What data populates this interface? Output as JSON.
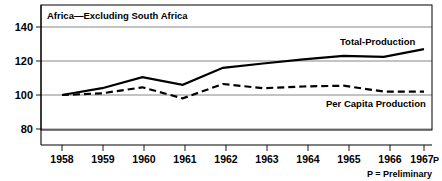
{
  "chart_data": {
    "type": "line",
    "title": "Africa—Excluding South Africa",
    "xlabel": "",
    "ylabel": "",
    "categories": [
      "1958",
      "1959",
      "1960",
      "1961",
      "1962",
      "1963",
      "1964",
      "1965",
      "1966",
      "1967"
    ],
    "x_tick_labels": [
      "1958",
      "1959",
      "1960",
      "1961",
      "1962",
      "1963",
      "1964",
      "1965",
      "1966",
      "1967"
    ],
    "last_tick_suffix": "P",
    "y_tick_labels": [
      "80",
      "100",
      "120",
      "140"
    ],
    "y_ticks": [
      80,
      100,
      120,
      140
    ],
    "ylim": [
      72,
      148
    ],
    "xlim": [
      "1958",
      "1967"
    ],
    "grid": true,
    "legend_position": "inline-annotation",
    "series": [
      {
        "name": "Total-Production",
        "style": "solid",
        "label_text": "Total-Production",
        "values": [
          100,
          104,
          110.5,
          106,
          116,
          118.5,
          121,
          123,
          122.5,
          127
        ]
      },
      {
        "name": "Per Capita Production",
        "style": "dashed",
        "label_text": "Per Capita Production",
        "values": [
          100,
          101,
          104.5,
          98,
          106.5,
          104,
          105,
          105.5,
          102,
          102
        ]
      }
    ],
    "annotations": [
      {
        "name": "total-production-label",
        "text": "Total-Production"
      },
      {
        "name": "per-capita-production-label",
        "text": "Per Capita Production"
      }
    ],
    "footnote": "P = Preliminary",
    "colors": {
      "line": "#000000",
      "grid": "#555555",
      "background": "#ffffff",
      "border": "#000000"
    }
  }
}
